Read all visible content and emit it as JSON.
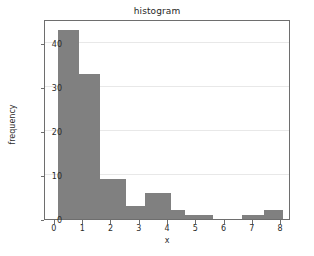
{
  "chart_data": {
    "type": "bar",
    "title": "histogram",
    "xlabel": "x",
    "ylabel": "frequency",
    "xlim": [
      -0.35,
      8.35
    ],
    "ylim": [
      0,
      45.5
    ],
    "grid": true,
    "grid_axis": "y",
    "legend": null,
    "bar_color": "#808080",
    "bin_edges": [
      0.1,
      0.85,
      1.6,
      2.5,
      3.2,
      4.1,
      4.6,
      5.6,
      6.6,
      7.4,
      8.05
    ],
    "values": [
      43,
      33,
      9,
      3,
      6,
      2,
      1,
      0,
      1,
      2
    ],
    "categories": [
      "0.1-0.85",
      "0.85-1.6",
      "1.6-2.5",
      "2.5-3.2",
      "3.2-4.1",
      "4.1-4.6",
      "4.6-5.6",
      "5.6-6.6",
      "6.6-7.4",
      "7.4-8.05"
    ],
    "xticks": [
      0,
      1,
      2,
      3,
      4,
      5,
      6,
      7,
      8
    ],
    "xticklabels": [
      "0",
      "1",
      "2",
      "3",
      "4",
      "5",
      "6",
      "7",
      "8"
    ],
    "yticks": [
      0,
      10,
      20,
      30,
      40
    ],
    "yticklabels": [
      "0",
      "10",
      "20",
      "30",
      "40"
    ]
  }
}
